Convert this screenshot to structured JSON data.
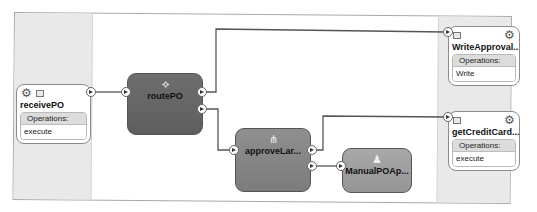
{
  "diagram": {
    "type": "SOA composite",
    "lanes": [
      "Exposed Services",
      "External References"
    ],
    "services": [
      {
        "id": "receivePO",
        "name": "receivePO",
        "ops_title": "Operations:",
        "operations": [
          "execute"
        ],
        "side": "left"
      },
      {
        "id": "writeApproval",
        "name": "WriteApproval...",
        "ops_title": "Operations:",
        "operations": [
          "Write"
        ],
        "side": "right"
      },
      {
        "id": "getCreditCard",
        "name": "getCreditCard...",
        "ops_title": "Operations:",
        "operations": [
          "execute"
        ],
        "side": "right"
      }
    ],
    "components": [
      {
        "id": "routePO",
        "name": "routePO",
        "icon": "mediator-icon",
        "color": "#666666"
      },
      {
        "id": "approveLarge",
        "name": "approveLar...",
        "icon": "bpel-process-icon",
        "color": "#888888"
      },
      {
        "id": "manualPOApproval",
        "name": "ManualPOAp...",
        "icon": "human-task-icon",
        "color": "#a0a0a0"
      }
    ],
    "wires": [
      {
        "from": "receivePO",
        "to": "routePO"
      },
      {
        "from": "routePO",
        "to": "writeApproval"
      },
      {
        "from": "routePO",
        "to": "approveLarge"
      },
      {
        "from": "approveLarge",
        "to": "getCreditCard"
      },
      {
        "from": "approveLarge",
        "to": "manualPOApproval"
      }
    ]
  }
}
